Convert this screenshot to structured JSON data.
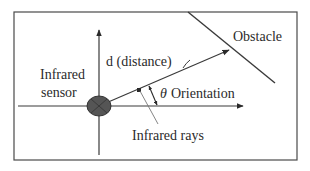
{
  "diagram": {
    "labels": {
      "obstacle": "Obstacle",
      "distance": "d (distance)",
      "sensor_line1": "Infrared",
      "sensor_line2": "sensor",
      "theta": "θ",
      "orientation": "Orientation",
      "rays": "Infrared rays"
    },
    "colors": {
      "line": "#3a3a3a",
      "frame": "#4a4a4a",
      "sensor_fill": "#555555",
      "text": "#2b2b2b"
    }
  }
}
